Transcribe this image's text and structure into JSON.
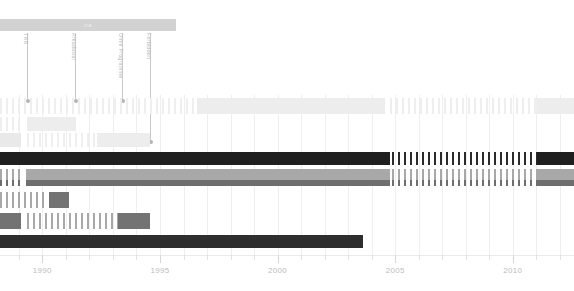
{
  "header": {
    "band_label": "ira",
    "band_color": "#d2d2d2"
  },
  "annotations": [
    {
      "name": "annotation-1",
      "label": "TRR",
      "x": 27,
      "height": 68
    },
    {
      "name": "annotation-2",
      "label": "Arkadaslar",
      "x": 75,
      "height": 68
    },
    {
      "name": "annotation-3",
      "label": "Omni Programme",
      "x": 122,
      "height": 68
    },
    {
      "name": "annotation-4",
      "label": "Forbidden",
      "x": 150,
      "height": 109
    }
  ],
  "axis": {
    "x_min": 1988.2,
    "x_max": 2012.6,
    "major_ticks": [
      1990,
      1995,
      2000,
      2005,
      2010
    ],
    "major_labels": [
      "1990",
      "1995",
      "2000",
      "2005",
      "2010"
    ],
    "minor_step": 1
  },
  "colors": {
    "black": "#1f1f1f",
    "dark": "#2e2e2e",
    "mid_gray": "#737373",
    "gray": "#a8a8a8",
    "light_gray": "#c9c9c9",
    "pale_gray": "#e6e6e6",
    "paler_gray": "#efefef",
    "grid": "#efefef",
    "axis_text": "#bdbdbd"
  },
  "chart_data": {
    "type": "bar",
    "title": "ira",
    "xlabel": "",
    "ylabel": "",
    "orientation": "horizontal-timeline",
    "xlim": [
      1988.2,
      2012.6
    ],
    "grid": true,
    "legend": "none",
    "tick_labels": [
      "1990",
      "1995",
      "2000",
      "2005",
      "2010"
    ],
    "annotations": [
      {
        "label": "TRR",
        "x_px": 27
      },
      {
        "label": "Arkadaslar",
        "x_px": 75
      },
      {
        "label": "Omni Programme",
        "x_px": 122
      },
      {
        "label": "Forbidden",
        "x_px": 150
      }
    ],
    "rows": [
      {
        "name": "row-1",
        "top": 3,
        "height": 16,
        "segments": [
          {
            "x": 0,
            "w": 197,
            "color": "#efefef",
            "fill": "striped"
          },
          {
            "x": 197,
            "w": 188,
            "color": "#ededed",
            "fill": "solid"
          },
          {
            "x": 390,
            "w": 147,
            "color": "#eeeeee",
            "fill": "striped"
          },
          {
            "x": 537,
            "w": 37,
            "color": "#ededed",
            "fill": "solid"
          }
        ]
      },
      {
        "name": "row-2",
        "top": 22,
        "height": 14,
        "segments": [
          {
            "x": 0,
            "w": 20,
            "color": "#efefef",
            "fill": "striped"
          },
          {
            "x": 27,
            "w": 49,
            "color": "#ededed",
            "fill": "solid"
          }
        ]
      },
      {
        "name": "row-3",
        "top": 38,
        "height": 14,
        "segments": [
          {
            "x": 0,
            "w": 21,
            "color": "#e9e9e9",
            "fill": "solid"
          },
          {
            "x": 27,
            "w": 70,
            "color": "#efefef",
            "fill": "striped"
          },
          {
            "x": 97,
            "w": 53,
            "color": "#ededed",
            "fill": "solid"
          }
        ]
      },
      {
        "name": "row-4",
        "top": 57,
        "height": 13,
        "segments": [
          {
            "x": 0,
            "w": 390,
            "color": "#1f1f1f",
            "fill": "fine"
          },
          {
            "x": 392,
            "w": 145,
            "color": "#2b2b2b",
            "fill": "striped"
          },
          {
            "x": 537,
            "w": 37,
            "color": "#1f1f1f",
            "fill": "solid"
          }
        ]
      },
      {
        "name": "row-5",
        "top": 74,
        "height": 11,
        "segments": [
          {
            "x": 0,
            "w": 21,
            "color": "#a8a8a8",
            "fill": "striped"
          },
          {
            "x": 26,
            "w": 364,
            "color": "#a8a8a8",
            "fill": "solid"
          },
          {
            "x": 392,
            "w": 145,
            "color": "#a8a8a8",
            "fill": "striped"
          },
          {
            "x": 537,
            "w": 37,
            "color": "#a8a8a8",
            "fill": "solid"
          }
        ]
      },
      {
        "name": "row-6",
        "top": 85,
        "height": 6,
        "segments": [
          {
            "x": 0,
            "w": 21,
            "color": "#6e6e6e",
            "fill": "striped"
          },
          {
            "x": 26,
            "w": 364,
            "color": "#6e6e6e",
            "fill": "solid"
          },
          {
            "x": 392,
            "w": 145,
            "color": "#6e6e6e",
            "fill": "striped"
          },
          {
            "x": 537,
            "w": 37,
            "color": "#6e6e6e",
            "fill": "solid"
          }
        ]
      },
      {
        "name": "row-7",
        "top": 97,
        "height": 16,
        "segments": [
          {
            "x": 0,
            "w": 47,
            "color": "#a8a8a8",
            "fill": "striped"
          },
          {
            "x": 49,
            "w": 20,
            "color": "#737373",
            "fill": "solid"
          }
        ]
      },
      {
        "name": "row-8",
        "top": 118,
        "height": 16,
        "segments": [
          {
            "x": 0,
            "w": 21,
            "color": "#737373",
            "fill": "solid"
          },
          {
            "x": 27,
            "w": 91,
            "color": "#a8a8a8",
            "fill": "striped"
          },
          {
            "x": 118,
            "w": 32,
            "color": "#737373",
            "fill": "solid"
          }
        ]
      },
      {
        "name": "row-9",
        "top": 140,
        "height": 13,
        "segments": [
          {
            "x": 0,
            "w": 363,
            "color": "#2e2e2e",
            "fill": "fine"
          }
        ]
      }
    ]
  }
}
